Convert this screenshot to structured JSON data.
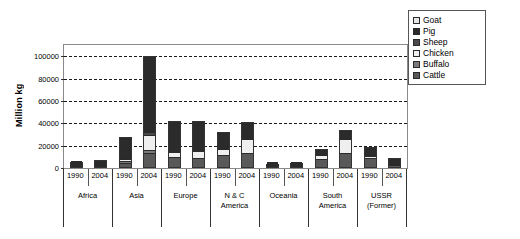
{
  "chart_data": {
    "type": "bar",
    "subtype": "stacked",
    "title": "",
    "xlabel": "",
    "ylabel": "Million kg",
    "ylim": [
      0,
      110000
    ],
    "yticks": [
      0,
      20000,
      40000,
      60000,
      80000,
      100000
    ],
    "ytick_labels": [
      "0",
      "20000",
      "40000",
      "60000",
      "80000",
      "100000"
    ],
    "grid": true,
    "legend_position": "top-right",
    "categories": [
      "1990",
      "2004",
      "1990",
      "2004",
      "1990",
      "2004",
      "1990",
      "2004",
      "1990",
      "2004",
      "1990",
      "2004",
      "1990",
      "2004"
    ],
    "groups": [
      {
        "label": "Africa",
        "years": [
          "1990",
          "2004"
        ]
      },
      {
        "label": "Asia",
        "years": [
          "1990",
          "2004"
        ]
      },
      {
        "label": "Europe",
        "years": [
          "1990",
          "2004"
        ]
      },
      {
        "label": "N & C\nAmerica",
        "years": [
          "1990",
          "2004"
        ]
      },
      {
        "label": "Oceania",
        "years": [
          "1990",
          "2004"
        ]
      },
      {
        "label": "South\nAmerica",
        "years": [
          "1990",
          "2004"
        ]
      },
      {
        "label": "USSR\n(Former)",
        "years": [
          "1990",
          "2004"
        ]
      }
    ],
    "series": [
      {
        "name": "Cattle",
        "color": "#595959",
        "values": [
          2600,
          3200,
          4200,
          12500,
          9800,
          8200,
          12000,
          13500,
          2200,
          2700,
          8800,
          14000,
          9000,
          3400
        ]
      },
      {
        "name": "Buffalo",
        "color": "#7a7a7a",
        "values": [
          400,
          500,
          1400,
          2600,
          0,
          0,
          0,
          0,
          0,
          0,
          0,
          0,
          0,
          0
        ]
      },
      {
        "name": "Chicken",
        "color": "#efefef",
        "values": [
          700,
          1100,
          1900,
          14500,
          4400,
          6600,
          6000,
          13500,
          400,
          600,
          4200,
          14000,
          2500,
          1000
        ]
      },
      {
        "name": "Sheep",
        "color": "#4a4a4a",
        "values": [
          600,
          700,
          1500,
          2400,
          1500,
          1100,
          300,
          300,
          900,
          800,
          300,
          300,
          1200,
          400
        ]
      },
      {
        "name": "Pig",
        "color": "#2b2b2b",
        "values": [
          700,
          900,
          17800,
          67000,
          26000,
          26000,
          14000,
          14000,
          400,
          500,
          3600,
          6000,
          6000,
          4000
        ]
      },
      {
        "name": "Goat",
        "color": "#e6e6e6",
        "values": [
          300,
          400,
          500,
          1200,
          100,
          100,
          100,
          100,
          50,
          50,
          100,
          100,
          200,
          100
        ]
      }
    ],
    "legend_entries": [
      {
        "label": "Goat",
        "color": "#e6e6e6"
      },
      {
        "label": "Pig",
        "color": "#2b2b2b"
      },
      {
        "label": "Sheep",
        "color": "#4a4a4a"
      },
      {
        "label": "Chicken",
        "color": "#efefef"
      },
      {
        "label": "Buffalo",
        "color": "#7a7a7a"
      },
      {
        "label": "Cattle",
        "color": "#595959"
      }
    ],
    "stack_order_bottom_to_top": [
      "Cattle",
      "Buffalo",
      "Chicken",
      "Sheep",
      "Pig",
      "Goat"
    ]
  }
}
